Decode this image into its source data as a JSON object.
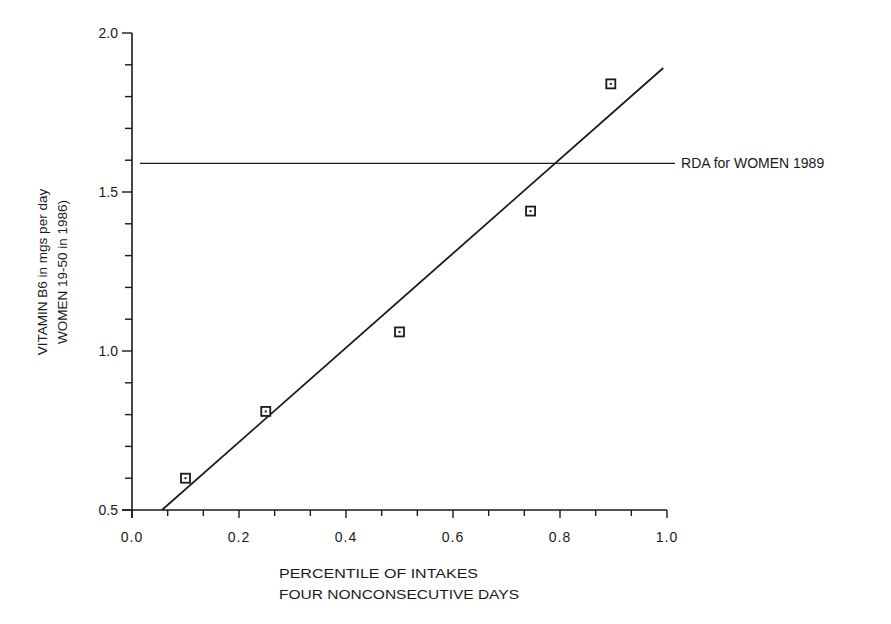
{
  "chart_data": {
    "type": "scatter",
    "title": "",
    "xlabel_lines": [
      "PERCENTILE OF INTAKES",
      "FOUR NONCONSECUTIVE DAYS"
    ],
    "ylabel_lines": [
      "VITAMIN B6 in mgs per day",
      "WOMEN 19-50 in 1986)"
    ],
    "xlim": [
      0.0,
      1.0
    ],
    "ylim": [
      0.5,
      2.0
    ],
    "x_ticks": [
      0.0,
      0.2,
      0.4,
      0.6,
      0.8,
      1.0
    ],
    "x_tick_labels": [
      "0.0",
      "0.2",
      "0.4",
      "0.6",
      "0.8",
      "1.0"
    ],
    "x_minor_step": 0.0667,
    "y_ticks": [
      0.5,
      1.0,
      1.5,
      2.0
    ],
    "y_tick_labels": [
      "0.5",
      "1.0",
      "1.5",
      "2.0"
    ],
    "y_minor_step": 0.1,
    "grid": false,
    "series": [
      {
        "name": "Observed intakes",
        "marker": "square-dot",
        "x": [
          0.1,
          0.25,
          0.5,
          0.745,
          0.895
        ],
        "y": [
          0.6,
          0.81,
          1.06,
          1.44,
          1.84
        ]
      }
    ],
    "fit_line": {
      "name": "Linear fit",
      "x": [
        0.056,
        0.993
      ],
      "y": [
        0.5,
        1.89
      ]
    },
    "reference_lines": [
      {
        "label": "RDA for WOMEN 1989",
        "y": 1.59,
        "x_range": [
          0.015,
          1.015
        ]
      }
    ]
  }
}
